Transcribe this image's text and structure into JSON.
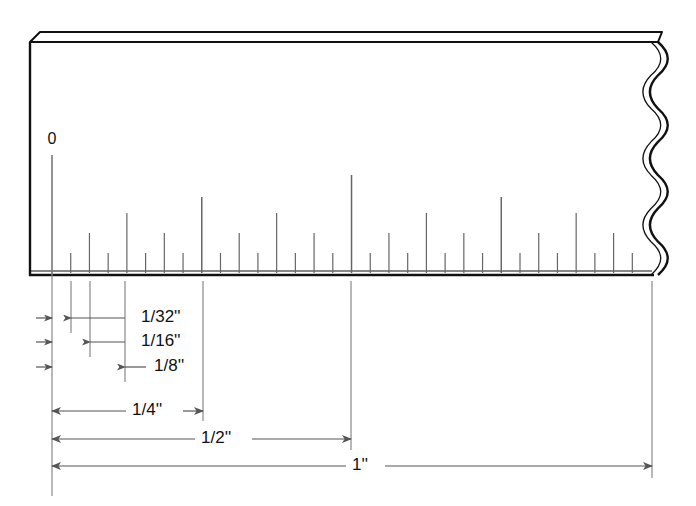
{
  "figure": {
    "kind": "ruler-fraction-diagram",
    "background_color": "#ffffff",
    "ink_color": "#111111",
    "dim_color": "#555555"
  },
  "ruler": {
    "zero_label": "0",
    "body": {
      "left_x": 30,
      "right_x": 668,
      "top_y": 32,
      "baseline_y": 275,
      "bevel_offset": 10
    },
    "scale": {
      "divisions_per_inch": 32,
      "pixels_per_division": 18.72,
      "origin_x": 52,
      "inch_width_px": 599
    },
    "break_edge": "wavy-double-line",
    "tick_levels": [
      {
        "name": "1/32",
        "denominator": 32,
        "height": 22
      },
      {
        "name": "1/16",
        "denominator": 16,
        "height": 42
      },
      {
        "name": "1/8",
        "denominator": 8,
        "height": 62
      },
      {
        "name": "1/4",
        "denominator": 4,
        "height": 78
      },
      {
        "name": "1/2",
        "denominator": 2,
        "height": 100
      },
      {
        "name": "1",
        "denominator": 1,
        "height": 100
      }
    ]
  },
  "callouts": [
    {
      "id": "thirty-seconds",
      "label": "1/32''",
      "from_x": 71,
      "to_x": 90,
      "y": 318,
      "label_x": 133,
      "leader_to": 125
    },
    {
      "id": "sixteenths",
      "label": "1/16''",
      "from_x": 90,
      "to_x": 125,
      "y": 342,
      "label_x": 133,
      "leader_to": 125
    },
    {
      "id": "eighths",
      "label": "1/8''",
      "from_x": 125,
      "to_x": 146,
      "y": 367,
      "label_x": 146,
      "leader_to": 146
    }
  ],
  "dimensions": [
    {
      "id": "quarter-inch",
      "label": "1/4''",
      "from_x": 52,
      "to_x": 203,
      "y": 411,
      "label_x": 132
    },
    {
      "id": "half-inch",
      "label": "1/2''",
      "from_x": 52,
      "to_x": 351,
      "y": 439,
      "label_x": 201
    },
    {
      "id": "one-inch",
      "label": "1''",
      "from_x": 52,
      "to_x": 652,
      "y": 466,
      "label_x": 352
    }
  ],
  "extension_lines": [
    {
      "id": "ext-0",
      "x": 52,
      "from_y": 275,
      "to_y": 496
    },
    {
      "id": "ext-1-32",
      "x": 71,
      "from_y": 281,
      "to_y": 333
    },
    {
      "id": "ext-1-16",
      "x": 90,
      "from_y": 281,
      "to_y": 357
    },
    {
      "id": "ext-1-8",
      "x": 125,
      "from_y": 281,
      "to_y": 382
    },
    {
      "id": "ext-1-4",
      "x": 203,
      "from_y": 281,
      "to_y": 421
    },
    {
      "id": "ext-1-2",
      "x": 351,
      "from_y": 281,
      "to_y": 450
    },
    {
      "id": "ext-1-in",
      "x": 652,
      "from_y": 281,
      "to_y": 478
    }
  ],
  "left_arrows": [
    {
      "id": "left-arrow-1-32",
      "y": 318
    },
    {
      "id": "left-arrow-1-16",
      "y": 342
    },
    {
      "id": "left-arrow-1-8",
      "y": 367
    }
  ]
}
